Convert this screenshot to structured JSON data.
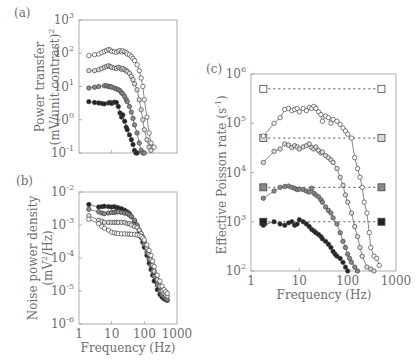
{
  "figure": {
    "panels": [
      "(a)",
      "(b)",
      "(c)"
    ]
  },
  "chart_data": [
    {
      "panel": "(a)",
      "type": "line",
      "xscale": "log",
      "yscale": "log",
      "xlim": [
        1,
        1000
      ],
      "ylim": [
        0.1,
        1000
      ],
      "title": "",
      "xlabel": "",
      "ylabel": "Power transfer (mV/unit contrast)²",
      "ylabel_lines": [
        "Power transfer",
        "(mV/unit contrast)"
      ],
      "ylabel_sup": "2",
      "yticks": [
        {
          "b": "10",
          "e": "3",
          "v": 1000
        },
        {
          "b": "10",
          "e": "2",
          "v": 100
        },
        {
          "b": "10",
          "e": "1",
          "v": 10
        },
        {
          "b": "10",
          "e": "0",
          "v": 1
        },
        {
          "b": "10",
          "e": "-1",
          "v": 0.1
        }
      ],
      "xticks": [],
      "xtickmarks": [
        10,
        100
      ],
      "grid": false,
      "series": [
        {
          "name": "contrast 1 (open)",
          "marker": "open-circle",
          "fill": "#ffffff",
          "x": [
            2,
            3,
            4,
            5,
            6,
            7,
            8,
            9,
            10,
            12,
            14,
            16,
            18,
            20,
            22,
            25,
            28,
            30,
            35,
            40,
            45,
            50,
            60,
            70,
            80,
            90,
            100,
            120,
            140,
            160,
            180,
            200
          ],
          "y": [
            85,
            90,
            95,
            105,
            115,
            120,
            130,
            125,
            115,
            110,
            108,
            115,
            120,
            110,
            118,
            112,
            105,
            95,
            90,
            80,
            70,
            60,
            45,
            30,
            18,
            10,
            4,
            1.2,
            0.4,
            0.2,
            0.15,
            0.15
          ]
        },
        {
          "name": "contrast 2 (light grey)",
          "marker": "circle",
          "fill": "#dcdcdc",
          "x": [
            2,
            3,
            4,
            5,
            6,
            7,
            8,
            9,
            10,
            12,
            14,
            16,
            18,
            20,
            22,
            25,
            28,
            30,
            35,
            40,
            45,
            50,
            60,
            70,
            80,
            90,
            100,
            120,
            140,
            160
          ],
          "y": [
            30,
            30,
            32,
            35,
            38,
            40,
            42,
            40,
            38,
            36,
            35,
            38,
            36,
            33,
            35,
            32,
            30,
            28,
            25,
            20,
            16,
            12,
            8,
            4,
            2,
            1,
            0.5,
            0.25,
            0.15,
            0.12
          ]
        },
        {
          "name": "contrast 3 (dark grey)",
          "marker": "circle",
          "fill": "#8a8a8a",
          "x": [
            2,
            3,
            4,
            6,
            7,
            8,
            9,
            10,
            12,
            14,
            16,
            18,
            20,
            22,
            25,
            28,
            30,
            35,
            40,
            45,
            50,
            60,
            70,
            80,
            90,
            100
          ],
          "y": [
            9,
            9.5,
            10,
            10.5,
            10.5,
            10,
            10,
            9.5,
            9,
            8.5,
            8,
            7.5,
            6.5,
            6,
            5,
            4,
            3.5,
            2.5,
            1.7,
            1.1,
            0.7,
            0.4,
            0.2,
            0.12,
            0.1,
            0.1
          ]
        },
        {
          "name": "contrast 4 (filled)",
          "marker": "filled-circle",
          "fill": "#222222",
          "x": [
            2,
            3,
            4,
            5,
            6,
            8,
            9,
            10,
            12,
            14,
            16,
            18,
            20,
            22,
            25,
            28,
            30,
            35,
            40,
            45,
            50,
            55,
            60
          ],
          "y": [
            3.5,
            3.3,
            3.2,
            3.1,
            3,
            3.2,
            3.3,
            3.1,
            3.4,
            3.3,
            2.5,
            1.6,
            1.2,
            1.4,
            0.9,
            0.6,
            0.5,
            0.35,
            0.25,
            0.18,
            0.12,
            0.1,
            0.1
          ]
        }
      ]
    },
    {
      "panel": "(b)",
      "type": "line",
      "xscale": "log",
      "yscale": "log",
      "xlim": [
        1,
        1000
      ],
      "ylim": [
        1e-06,
        0.01
      ],
      "title": "",
      "xlabel": "Frequency (Hz)",
      "ylabel": "Noise power density (mV²/Hz)",
      "ylabel_lines": [
        "Noise power density",
        "(mV"
      ],
      "ylabel_tail": "/Hz)",
      "ylabel_sup": "2",
      "yticks": [
        {
          "b": "10",
          "e": "-2",
          "v": 0.01
        },
        {
          "b": "10",
          "e": "-3",
          "v": 0.001
        },
        {
          "b": "10",
          "e": "-4",
          "v": 0.0001
        },
        {
          "b": "10",
          "e": "-5",
          "v": 1e-05
        },
        {
          "b": "10",
          "e": "-6",
          "v": 1e-06
        }
      ],
      "xticks": [
        {
          "label": "1",
          "v": 1
        },
        {
          "label": "10",
          "v": 10
        },
        {
          "label": "100",
          "v": 100
        },
        {
          "label": "1000",
          "v": 1000
        }
      ],
      "grid": false,
      "series": [
        {
          "name": "filled",
          "marker": "filled-circle",
          "fill": "#222222",
          "x": [
            2,
            4,
            5,
            6,
            8,
            10,
            12,
            14,
            16,
            20,
            25,
            30,
            35,
            40,
            50,
            60,
            70,
            80,
            90,
            100,
            120,
            140,
            160,
            180,
            200,
            250,
            300,
            350,
            400,
            450,
            500
          ],
          "y": [
            0.0042,
            0.0035,
            0.0036,
            0.0037,
            0.0036,
            0.0035,
            0.0036,
            0.0034,
            0.0033,
            0.0031,
            0.0028,
            0.0025,
            0.0022,
            0.0018,
            0.0013,
            0.0009,
            0.0006,
            0.00042,
            0.0003,
            0.00021,
            0.00012,
            7e-05,
            4.5e-05,
            3e-05,
            2e-05,
            1.1e-05,
            7.8e-06,
            6.5e-06,
            5.8e-06,
            5.5e-06,
            5.2e-06
          ]
        },
        {
          "name": "dark grey",
          "marker": "circle",
          "fill": "#8a8a8a",
          "x": [
            2,
            4,
            5,
            6,
            8,
            10,
            12,
            14,
            16,
            20,
            25,
            30,
            35,
            40,
            50,
            60,
            70,
            80,
            90,
            100,
            120,
            140,
            160,
            180,
            200,
            250,
            300,
            350,
            400,
            450,
            500
          ],
          "y": [
            0.003,
            0.0025,
            0.0023,
            0.0022,
            0.0023,
            0.0024,
            0.0024,
            0.0025,
            0.0025,
            0.0024,
            0.0023,
            0.0022,
            0.002,
            0.0018,
            0.0014,
            0.001,
            0.0007,
            0.0005,
            0.00036,
            0.00026,
            0.00015,
            9e-05,
            6e-05,
            4e-05,
            2.8e-05,
            1.5e-05,
            1e-05,
            7.8e-06,
            6.8e-06,
            6e-06,
            5.6e-06
          ]
        },
        {
          "name": "light grey",
          "marker": "circle",
          "fill": "#dcdcdc",
          "x": [
            2,
            4,
            5,
            6,
            8,
            10,
            12,
            14,
            16,
            20,
            25,
            30,
            35,
            40,
            50,
            60,
            70,
            80,
            90,
            100,
            120,
            140,
            160,
            180,
            200,
            250,
            300,
            350,
            400,
            450,
            500
          ],
          "y": [
            0.0019,
            0.0014,
            0.0013,
            0.0012,
            0.0012,
            0.0012,
            0.0012,
            0.0012,
            0.0012,
            0.0012,
            0.0012,
            0.0011,
            0.0011,
            0.001,
            0.0009,
            0.00085,
            0.0007,
            0.00055,
            0.00043,
            0.00033,
            0.0002,
            0.00013,
            9e-05,
            6e-05,
            4e-05,
            2.2e-05,
            1.4e-05,
            1e-05,
            8.5e-06,
            7.5e-06,
            7e-06
          ]
        },
        {
          "name": "open",
          "marker": "open-circle",
          "fill": "#ffffff",
          "x": [
            2,
            4,
            5,
            6,
            8,
            10,
            12,
            14,
            16,
            20,
            25,
            30,
            35,
            40,
            50,
            60,
            70,
            80,
            90,
            100,
            120,
            140,
            160,
            180,
            200,
            250,
            300,
            350,
            400,
            450,
            500
          ],
          "y": [
            0.0015,
            0.0011,
            0.0009,
            0.0008,
            0.0007,
            0.0006,
            0.00058,
            0.00056,
            0.00055,
            0.00054,
            0.00054,
            0.00053,
            0.00053,
            0.00052,
            0.00052,
            0.0005,
            0.00048,
            0.00045,
            0.0004,
            0.00035,
            0.00025,
            0.00017,
            0.00012,
            8e-05,
            5.5e-05,
            3e-05,
            2e-05,
            1.4e-05,
            1.1e-05,
            9.5e-06,
            8.5e-06
          ]
        }
      ]
    },
    {
      "panel": "(c)",
      "type": "line",
      "xscale": "log",
      "yscale": "log",
      "xlim": [
        1,
        1000
      ],
      "ylim": [
        100,
        1000000
      ],
      "title": "",
      "xlabel": "Frequency (Hz)",
      "ylabel": "Effective Poisson rate (s⁻¹)",
      "ylabel_lines": [
        "Effective Poisson rate (s"
      ],
      "ylabel_tail": ")",
      "ylabel_sup": "-1",
      "yticks": [
        {
          "b": "10",
          "e": "6",
          "v": 1000000
        },
        {
          "b": "10",
          "e": "5",
          "v": 100000
        },
        {
          "b": "10",
          "e": "4",
          "v": 10000
        },
        {
          "b": "10",
          "e": "3",
          "v": 1000
        },
        {
          "b": "10",
          "e": "2",
          "v": 100
        }
      ],
      "xticks": [
        {
          "label": "1",
          "v": 1
        },
        {
          "label": "10",
          "v": 10
        },
        {
          "label": "100",
          "v": 100
        },
        {
          "label": "1000",
          "v": 1000
        }
      ],
      "grid": false,
      "reference_lines": [
        {
          "name": "open square level",
          "y": 500000,
          "x": [
            1.8,
            500
          ],
          "fill": "#ffffff"
        },
        {
          "name": "light grey square level",
          "y": 50000,
          "x": [
            1.8,
            500
          ],
          "fill": "#dcdcdc"
        },
        {
          "name": "dark grey square level",
          "y": 5000,
          "x": [
            1.8,
            500
          ],
          "fill": "#8a8a8a"
        },
        {
          "name": "filled square level",
          "y": 1000,
          "x": [
            1.8,
            500
          ],
          "fill": "#222222"
        }
      ],
      "series": [
        {
          "name": "open",
          "marker": "open-circle",
          "fill": "#ffffff",
          "x": [
            1.8,
            3,
            4,
            5,
            6,
            7,
            8,
            9,
            10,
            12,
            14,
            16,
            18,
            20,
            22,
            25,
            28,
            30,
            35,
            40,
            45,
            50,
            60,
            70,
            80,
            90,
            100,
            120,
            140,
            160,
            180,
            200,
            220,
            250,
            280,
            300,
            350,
            400,
            450
          ],
          "y": [
            55000,
            100000,
            130000,
            190000,
            200000,
            180000,
            190000,
            200000,
            170000,
            200000,
            180000,
            210000,
            200000,
            220000,
            200000,
            170000,
            150000,
            110000,
            140000,
            130000,
            100000,
            120000,
            110000,
            95000,
            80000,
            70000,
            60000,
            50000,
            20000,
            12000,
            8000,
            5000,
            2500,
            1500,
            600,
            300,
            200,
            180,
            130
          ]
        },
        {
          "name": "light grey",
          "marker": "circle",
          "fill": "#dcdcdc",
          "x": [
            1.8,
            3,
            4,
            5,
            6,
            7,
            8,
            9,
            10,
            12,
            14,
            16,
            18,
            20,
            22,
            25,
            28,
            30,
            35,
            40,
            45,
            50,
            60,
            70,
            80,
            90,
            100,
            120,
            140,
            160,
            180,
            200,
            250,
            300,
            350
          ],
          "y": [
            16000,
            27000,
            30000,
            38000,
            36000,
            32000,
            35000,
            33000,
            30000,
            33000,
            35000,
            38000,
            32000,
            30000,
            33000,
            28000,
            25000,
            26000,
            22000,
            20000,
            18000,
            16000,
            12000,
            8000,
            5500,
            3500,
            2500,
            1500,
            800,
            500,
            300,
            200,
            120,
            110,
            100
          ]
        },
        {
          "name": "dark grey",
          "marker": "circle",
          "fill": "#8a8a8a",
          "x": [
            1.8,
            3,
            4,
            5,
            6,
            7,
            8,
            9,
            10,
            12,
            14,
            16,
            18,
            20,
            22,
            25,
            28,
            30,
            35,
            40,
            45,
            50,
            60,
            70,
            80,
            90,
            100,
            110,
            120,
            140,
            160
          ],
          "y": [
            3000,
            4200,
            5000,
            5200,
            5300,
            5000,
            4800,
            4500,
            4600,
            4500,
            4200,
            4000,
            4800,
            3800,
            3500,
            3200,
            2800,
            2500,
            2000,
            1700,
            1500,
            1200,
            900,
            600,
            400,
            300,
            220,
            180,
            150,
            120,
            100
          ]
        },
        {
          "name": "filled",
          "marker": "filled-circle",
          "fill": "#222222",
          "x": [
            1.8,
            3,
            4,
            5,
            6,
            7,
            8,
            9,
            10,
            12,
            14,
            16,
            18,
            20,
            22,
            25,
            28,
            30,
            35,
            40,
            45,
            50,
            55,
            60,
            70,
            80,
            90,
            100
          ],
          "y": [
            850,
            1000,
            900,
            850,
            950,
            1000,
            850,
            900,
            1100,
            1000,
            900,
            800,
            700,
            650,
            600,
            550,
            500,
            450,
            400,
            350,
            300,
            250,
            220,
            200,
            180,
            150,
            120,
            100
          ]
        }
      ]
    }
  ]
}
